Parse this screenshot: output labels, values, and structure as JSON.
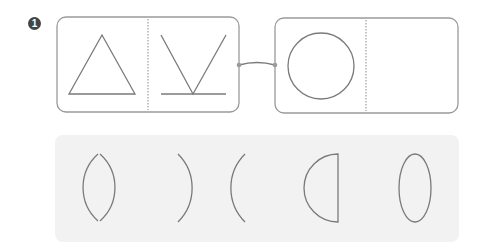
{
  "problem": {
    "number": "1"
  },
  "analogy": {
    "left_box": {
      "left_shape": "triangle",
      "right_shape": "v-with-base-line"
    },
    "right_box": {
      "left_shape": "circle",
      "right_shape": "empty"
    },
    "connector": "curved-line"
  },
  "options": {
    "items": [
      {
        "shape": "two-crossing-arcs-lens"
      },
      {
        "shape": "two-touching-arcs-back-to-back"
      },
      {
        "shape": "half-circle-d"
      },
      {
        "shape": "ellipse-vertical"
      }
    ]
  },
  "colors": {
    "stroke": "#7a7a7a",
    "box_border": "#9a9a9a",
    "panel_bg": "#f2f2f2",
    "badge_bg": "#444444"
  }
}
